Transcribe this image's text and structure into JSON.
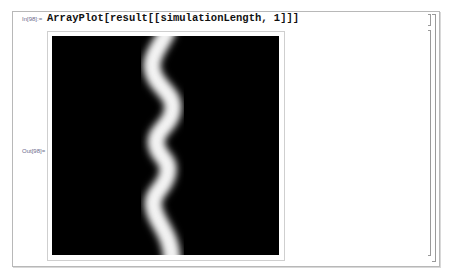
{
  "notebook": {
    "input_cell": {
      "label": "In[98]:=",
      "code": "ArrayPlot[result[[simulationLength, 1]]]"
    },
    "output_cell": {
      "label": "Out[98]=",
      "plot": {
        "type": "ArrayPlot",
        "background_color": "#000000",
        "foreground_color": "#ffffff",
        "description": "Black array with a single white wavy vertical band"
      }
    },
    "bracket_glyphs": {
      "input": "]",
      "output": "]"
    }
  }
}
